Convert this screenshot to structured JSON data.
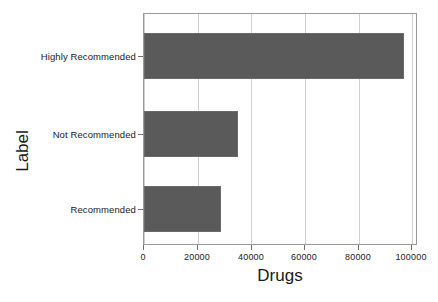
{
  "chart_data": {
    "type": "bar",
    "orientation": "horizontal",
    "title": "",
    "xlabel": "Drugs",
    "ylabel": "Label",
    "categories": [
      "Highly Recommended",
      "Not Recommended",
      "Recommended"
    ],
    "values": [
      97000,
      35000,
      28700
    ],
    "series": [
      {
        "name": "Drugs",
        "values": [
          97000,
          35000,
          28700
        ],
        "color": "#5a5a5a"
      }
    ],
    "xlim": [
      0,
      102300
    ],
    "xticks": [
      0,
      20000,
      40000,
      60000,
      80000,
      100000
    ],
    "xtick_labels": [
      "0",
      "20000",
      "40000",
      "60000",
      "80000",
      "100000"
    ],
    "ytick_labels": [
      "Highly Recommended",
      "Not Recommended",
      "Recommended"
    ],
    "grid": true,
    "grid_axis": "x",
    "legend": false,
    "legend_position": "none",
    "bar_color": "#5a5a5a",
    "axis_color": "#9a9a9a",
    "grid_color": "#d0d0d0",
    "background": "#ffffff"
  }
}
